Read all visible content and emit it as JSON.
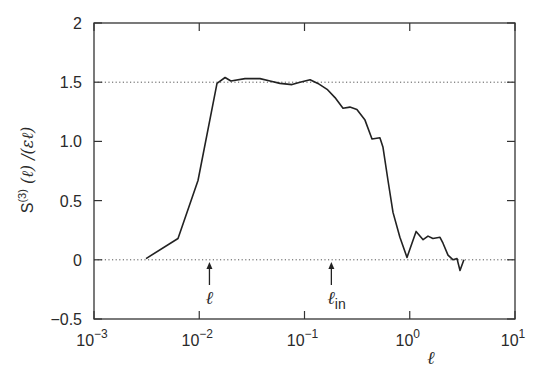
{
  "chart_data": {
    "type": "line",
    "title": "",
    "xlabel": "ℓ",
    "ylabel": "S(3) (ℓ) /(εℓ)",
    "ylabel_parts": {
      "S": "S",
      "sup": "(3)",
      "rest": " (ℓ) /(εℓ)"
    },
    "xscale": "log",
    "xlim": [
      0.001,
      10
    ],
    "ylim": [
      -0.5,
      2
    ],
    "x_ticks": [
      {
        "value": 0.001,
        "base": "10",
        "exp": "−3"
      },
      {
        "value": 0.01,
        "base": "10",
        "exp": "−2"
      },
      {
        "value": 0.1,
        "base": "10",
        "exp": "−1"
      },
      {
        "value": 1,
        "base": "10",
        "exp": "0"
      },
      {
        "value": 10,
        "base": "10",
        "exp": "1"
      }
    ],
    "y_ticks": [
      {
        "value": -0.5,
        "label": "−0.5"
      },
      {
        "value": 0,
        "label": "0"
      },
      {
        "value": 0.5,
        "label": "0.5"
      },
      {
        "value": 1.0,
        "label": "1.0"
      },
      {
        "value": 1.5,
        "label": "1.5"
      },
      {
        "value": 2,
        "label": "2"
      }
    ],
    "reference_lines": [
      {
        "y": 1.5,
        "style": "dotted"
      },
      {
        "y": 0,
        "style": "dotted"
      }
    ],
    "annotations": [
      {
        "text": "ℓ",
        "sub": "",
        "x": 0.0125,
        "arrow": "up"
      },
      {
        "text": "ℓ",
        "sub": "in",
        "x": 0.18,
        "arrow": "up"
      }
    ],
    "series": [
      {
        "name": "S3 normalized",
        "x": [
          0.00312,
          0.00628,
          0.00973,
          0.01475,
          0.0176,
          0.02,
          0.0272,
          0.0378,
          0.047,
          0.0585,
          0.076,
          0.0906,
          0.113,
          0.134,
          0.164,
          0.195,
          0.232,
          0.27,
          0.315,
          0.376,
          0.438,
          0.521,
          0.557,
          0.621,
          0.693,
          0.807,
          0.942,
          1.15,
          1.34,
          1.49,
          1.66,
          1.94,
          2.07,
          2.31,
          2.58,
          2.81,
          3.0,
          3.27
        ],
        "y": [
          0.01,
          0.18,
          0.67,
          1.49,
          1.54,
          1.51,
          1.53,
          1.53,
          1.51,
          1.49,
          1.48,
          1.5,
          1.52,
          1.49,
          1.44,
          1.37,
          1.28,
          1.29,
          1.27,
          1.18,
          1.02,
          1.03,
          0.95,
          0.67,
          0.4,
          0.19,
          0.02,
          0.24,
          0.17,
          0.2,
          0.18,
          0.19,
          0.14,
          0.04,
          0.0,
          0.01,
          -0.09,
          0.0
        ]
      }
    ],
    "grid": false,
    "legend": null
  }
}
